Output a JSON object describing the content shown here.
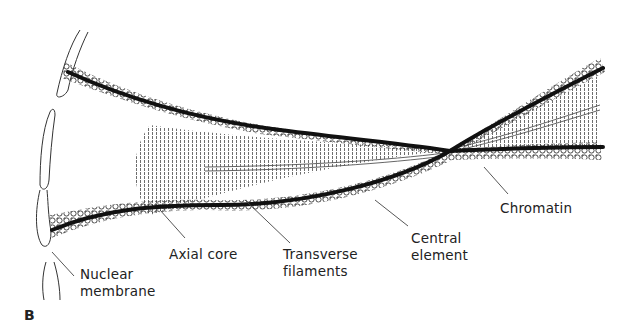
{
  "figure": {
    "panel_label": "B",
    "colors": {
      "background": "#ffffff",
      "axial_core": "#111111",
      "chromatin": "#333333",
      "filaments": "#555555",
      "label_text": "#222222",
      "leader_lines": "#444444"
    }
  },
  "labels": {
    "nuclear_membrane": "Nuclear\nmembrane",
    "nuclear_membrane_line1": "Nuclear",
    "nuclear_membrane_line2": "membrane",
    "axial_core": "Axial core",
    "transverse_filaments_line1": "Transverse",
    "transverse_filaments_line2": "filaments",
    "central_element_line1": "Central",
    "central_element_line2": "element",
    "chromatin": "Chromatin"
  }
}
